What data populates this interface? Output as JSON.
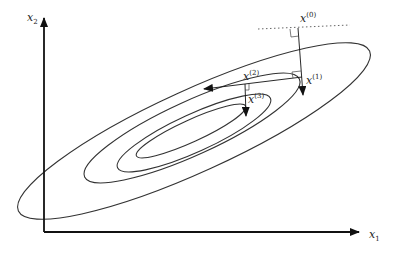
{
  "diagram": {
    "axes": {
      "x_label": "x",
      "x_sub": "1",
      "y_label": "x",
      "y_sub": "2"
    },
    "contours": [
      {
        "name": "contour-1",
        "cx": 194,
        "cy": 131,
        "rx": 193,
        "ry": 41,
        "rot": -24.5
      },
      {
        "name": "contour-2",
        "cx": 192,
        "cy": 128,
        "rx": 118,
        "ry": 27,
        "rot": -24.5
      },
      {
        "name": "contour-3",
        "cx": 194,
        "cy": 133,
        "rx": 84,
        "ry": 19,
        "rot": -24.5
      },
      {
        "name": "contour-4",
        "cx": 191,
        "cy": 131,
        "rx": 60,
        "ry": 11,
        "rot": -24.5
      }
    ],
    "iterates": [
      {
        "label": "x",
        "sup": "(0)"
      },
      {
        "label": "x",
        "sup": "(1)"
      },
      {
        "label": "x",
        "sup": "(2)"
      },
      {
        "label": "x",
        "sup": "(3)"
      }
    ],
    "colors": {
      "stroke": "#333333",
      "axis": "#111111",
      "background": "#ffffff"
    }
  }
}
